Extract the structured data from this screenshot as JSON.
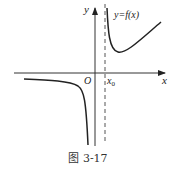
{
  "figure": {
    "caption": "图 3-17",
    "function_label": "y=f(x)",
    "axis_x_label": "x",
    "axis_y_label": "y",
    "origin_label": "O",
    "asymptote_label": "x",
    "asymptote_subscript": "0",
    "colors": {
      "curve": "#222222",
      "axis": "#333333",
      "asymptote": "#555555"
    }
  }
}
